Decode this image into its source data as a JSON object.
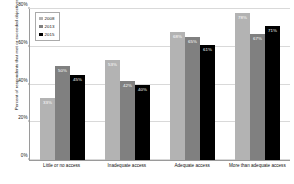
{
  "chart_data": {
    "type": "bar",
    "title": "",
    "subtitle": "",
    "xlabel": "",
    "ylabel": "Percent of respondents that met or exceeded objectives",
    "ylim": [
      0,
      80
    ],
    "ytick_labels": [
      "0%",
      "20%",
      "40%",
      "60%",
      "80%"
    ],
    "ytick_values": [
      0,
      20,
      40,
      60,
      80
    ],
    "grid": true,
    "legend_position": "top-left",
    "categories": [
      "Little or no access",
      "Inadequate access",
      "Adequate access",
      "More than adequate access"
    ],
    "series": [
      {
        "name": "2008",
        "color": "#b3b3b3",
        "values": [
          33,
          53,
          68,
          78
        ],
        "labels": [
          "33%",
          "53%",
          "68%",
          "78%"
        ]
      },
      {
        "name": "2013",
        "color": "#808080",
        "values": [
          50,
          42,
          65,
          67
        ],
        "labels": [
          "50%",
          "42%",
          "65%",
          "67%"
        ]
      },
      {
        "name": "2015",
        "color": "#000000",
        "values": [
          45,
          40,
          61,
          71
        ],
        "labels": [
          "45%",
          "40%",
          "61%",
          "71%"
        ]
      }
    ]
  },
  "legend": {
    "items": [
      {
        "label": "2008",
        "swatch": "#b3b3b3"
      },
      {
        "label": "2013",
        "swatch": "#808080"
      },
      {
        "label": "2015",
        "swatch": "#000000"
      }
    ]
  },
  "axes": {
    "y_title": "Percent of respondents that met or exceeded objectives",
    "y_ticks": [
      "80%",
      "60%",
      "40%",
      "20%",
      "0%"
    ],
    "x_ticks": [
      "Little or no access",
      "Inadequate access",
      "Adequate access",
      "More than adequate access"
    ]
  }
}
